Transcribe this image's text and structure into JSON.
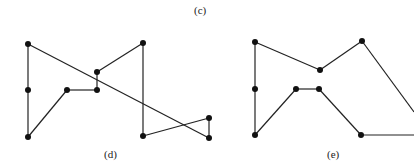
{
  "labels": {
    "c": "(c)",
    "d": "(d)",
    "e": "(e)"
  },
  "colors": {
    "line": "#222222",
    "node": "#111111"
  },
  "diagram_d": {
    "nodes": [
      [
        28,
        44
      ],
      [
        28,
        90
      ],
      [
        28,
        137
      ],
      [
        67,
        90
      ],
      [
        97,
        90
      ],
      [
        97,
        72
      ],
      [
        143,
        43
      ],
      [
        143,
        136
      ],
      [
        209,
        118
      ],
      [
        209,
        138
      ]
    ],
    "path_order": [
      0,
      1,
      2,
      3,
      4,
      5,
      6,
      7,
      8,
      9,
      0
    ]
  },
  "diagram_e": {
    "nodes": [
      [
        255,
        42
      ],
      [
        255,
        89
      ],
      [
        255,
        135
      ],
      [
        296,
        89
      ],
      [
        319,
        89
      ],
      [
        320,
        70
      ],
      [
        362,
        41
      ],
      [
        361,
        135
      ],
      [
        414,
        135
      ]
    ],
    "edges": [
      [
        0,
        1
      ],
      [
        1,
        2
      ],
      [
        2,
        3
      ],
      [
        3,
        4
      ],
      [
        4,
        7
      ],
      [
        7,
        8
      ],
      [
        0,
        5
      ],
      [
        5,
        6
      ]
    ],
    "offscreen_edge": [
      [
        362,
        41
      ],
      [
        414,
        112
      ]
    ]
  }
}
